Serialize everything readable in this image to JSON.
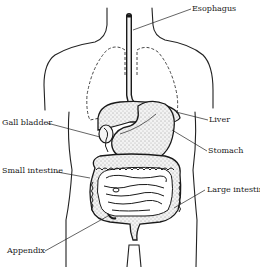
{
  "diagram": {
    "title": "",
    "labels": {
      "esophagus": "Esophagus",
      "liver": "Liver",
      "stomach": "Stomach",
      "gall_bladder": "Gall bladder",
      "small_intestine": "Small intestine",
      "large_intestine": "Large intestine",
      "appendix": "Appendix"
    },
    "colors": {
      "ink": "#1a1a1a",
      "background": "#ffffff"
    }
  }
}
